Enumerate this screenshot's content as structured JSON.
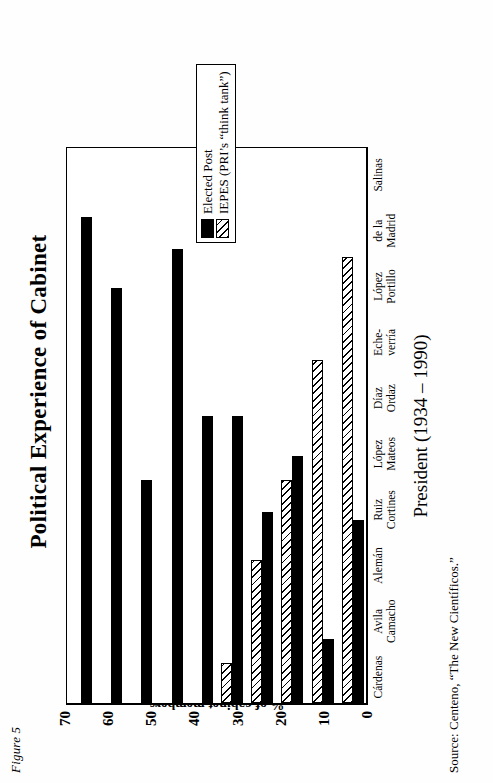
{
  "figure_number": "Figure 5",
  "title": "Political Experience of Cabinet",
  "source_note": "Source: Centeno, “The New Científicos.”",
  "legend": {
    "items": [
      {
        "label": "Elected Post",
        "pattern": "solid-black",
        "color": "#000000"
      },
      {
        "label": "IEPES (PRI’s “think tank”)",
        "pattern": "diagonal-hatch",
        "color": "#000000"
      }
    ]
  },
  "axes": {
    "y_title": "% of cabinet members",
    "x_title": "President (1934 – 1990)",
    "y_ticks": [
      "70",
      "60",
      "50",
      "40",
      "30",
      "20",
      "10",
      "0"
    ]
  },
  "chart_data": {
    "type": "bar",
    "title": "Political Experience of Cabinet",
    "xlabel": "President (1934 – 1990)",
    "ylabel": "% of cabinet members",
    "ylim": [
      0,
      70
    ],
    "grid": false,
    "legend_position": "right",
    "orientation": "vertical-bars-drawn-sideways",
    "categories": [
      "Cárdenas",
      "Avila Camacho",
      "Alemán",
      "Ruiz Cortines",
      "López Mateos",
      "Díaz Ordaz",
      "Eche-verría",
      "López Portillo",
      "de la Madrid",
      "Salinas"
    ],
    "category_labels_two_line": [
      [
        "Cárdenas",
        ""
      ],
      [
        "Avila",
        "Camacho"
      ],
      [
        "Alemán",
        ""
      ],
      [
        "Ruiz",
        "Cortines"
      ],
      [
        "López",
        "Mateos"
      ],
      [
        "Díaz",
        "Ordaz"
      ],
      [
        "Eche-",
        "verría"
      ],
      [
        "López",
        "Portillo"
      ],
      [
        "de la",
        "Madrid"
      ],
      [
        "Salinas",
        ""
      ]
    ],
    "series": [
      {
        "name": "Elected Post",
        "values": [
          61,
          52,
          28,
          57,
          36,
          36,
          24,
          31,
          8,
          23
        ]
      },
      {
        "name": "IEPES (PRI’s “think tank”)",
        "values": [
          0,
          0,
          0,
          0,
          0,
          5,
          18,
          28,
          43,
          56
        ]
      }
    ]
  }
}
